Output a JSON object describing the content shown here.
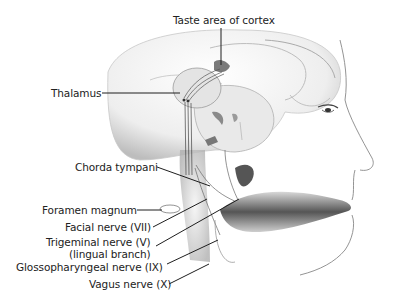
{
  "figure": {
    "labels": [
      {
        "id": "taste-cortex",
        "text": "Taste area of cortex"
      },
      {
        "id": "thalamus",
        "text": "Thalamus"
      },
      {
        "id": "chorda-tympani",
        "text": "Chorda tympani"
      },
      {
        "id": "foramen-magnum",
        "text": "Foramen magnum"
      },
      {
        "id": "facial-nerve",
        "text": "Facial nerve (VII)"
      },
      {
        "id": "trigeminal-nerve",
        "text": "Trigeminal nerve (V)"
      },
      {
        "id": "trigeminal-sub",
        "text": "(lingual branch)"
      },
      {
        "id": "glossopharyngeal-nerve",
        "text": "Glossopharyngeal nerve (IX)"
      },
      {
        "id": "vagus-nerve",
        "text": "Vagus nerve (X)"
      }
    ],
    "colors": {
      "background": "#ffffff",
      "line": "#1e1e1e",
      "shading": "#9a9a9a"
    }
  }
}
